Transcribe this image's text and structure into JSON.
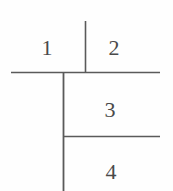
{
  "figure": {
    "type": "line-partition-diagram",
    "background_color": "#fefefe",
    "stroke_color": "#5a5a5a",
    "label_color": "#4a4a4a",
    "width": 173,
    "height": 191,
    "labels": [
      {
        "text": "1",
        "x": 47,
        "y": 48,
        "name": "region-label-1"
      },
      {
        "text": "2",
        "x": 114,
        "y": 48,
        "name": "region-label-2"
      },
      {
        "text": "3",
        "x": 110,
        "y": 110,
        "name": "region-label-3"
      },
      {
        "text": "4",
        "x": 111,
        "y": 172,
        "name": "region-label-4"
      }
    ],
    "lines": [
      {
        "name": "upper-divider-vertical",
        "x1": 85.5,
        "y1": 21,
        "x2": 85.5,
        "y2": 72.5,
        "width": 1.6
      },
      {
        "name": "main-horizontal",
        "x1": 11,
        "y1": 72.5,
        "x2": 160,
        "y2": 72.5,
        "width": 1.6
      },
      {
        "name": "main-vertical",
        "x1": 63.5,
        "y1": 72.5,
        "x2": 63.5,
        "y2": 191,
        "width": 1.8
      },
      {
        "name": "lower-horizontal",
        "x1": 63.5,
        "y1": 136.5,
        "x2": 160,
        "y2": 136.5,
        "width": 1.6
      }
    ]
  }
}
